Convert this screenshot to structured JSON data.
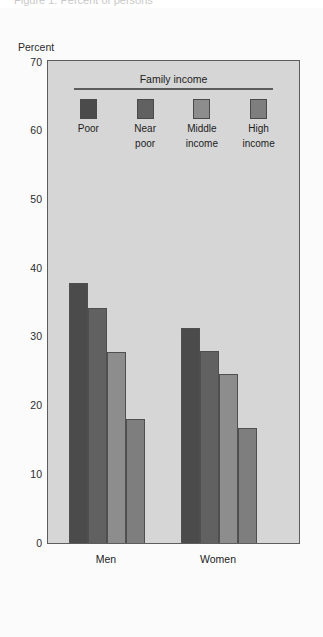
{
  "caption_remnant": "Figure 1.  Percent of persons",
  "axis": {
    "ylabel": "Percent",
    "yticks": [
      70,
      60,
      50,
      40,
      30,
      20,
      10,
      0
    ],
    "ymin": 0,
    "ymax": 70
  },
  "legend": {
    "title": "Family income",
    "items": [
      {
        "label_line1": "Poor",
        "label_line2": "",
        "color": "#4b4b4b"
      },
      {
        "label_line1": "Near",
        "label_line2": "poor",
        "color": "#616161"
      },
      {
        "label_line1": "Middle",
        "label_line2": "income",
        "color": "#8d8d8d"
      },
      {
        "label_line1": "High",
        "label_line2": "income",
        "color": "#7e7e7e"
      }
    ]
  },
  "colors": {
    "plot_background": "#d6d6d6",
    "frame": "#5d5d5d",
    "page_background": "#fbfbfb"
  },
  "chart_data": {
    "type": "bar",
    "title": "",
    "subtitle": "",
    "xlabel": "",
    "ylabel": "Percent",
    "ylim": [
      0,
      70
    ],
    "yticks": [
      0,
      10,
      20,
      30,
      40,
      50,
      60,
      70
    ],
    "grid": false,
    "legend_title": "Family income",
    "legend_position": "inside-top-center",
    "categories": [
      "Men",
      "Women"
    ],
    "series": [
      {
        "name": "Poor",
        "color": "#4b4b4b",
        "values": [
          37.8,
          31.3
        ]
      },
      {
        "name": "Near poor",
        "color": "#616161",
        "values": [
          34.2,
          27.9
        ]
      },
      {
        "name": "Middle income",
        "color": "#8d8d8d",
        "values": [
          27.8,
          24.6
        ]
      },
      {
        "name": "High income",
        "color": "#7e7e7e",
        "values": [
          18.1,
          16.8
        ]
      }
    ]
  }
}
